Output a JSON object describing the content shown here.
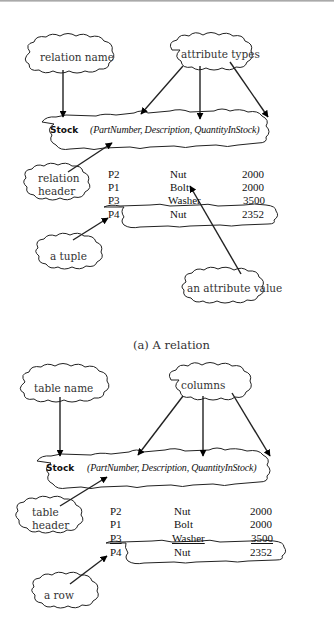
{
  "diagrams": [
    {
      "caption": "(a) A relation",
      "name_label": "relation name",
      "types_label": "attribute types",
      "header_label_line1": "relation",
      "header_label_line2": "header",
      "row_label": "a tuple",
      "value_label": "an attribute value",
      "header": {
        "name": "Stock",
        "attributes": "(PartNumber, Description, QuantityInStock)"
      },
      "rows": [
        [
          "P2",
          "Nut",
          "2000"
        ],
        [
          "P1",
          "Bolt",
          "2000"
        ],
        [
          "P3",
          "Washer",
          "3500"
        ],
        [
          "P4",
          "Nut",
          "2352"
        ]
      ]
    },
    {
      "name_label": "table name",
      "types_label": "columns",
      "header_label_line1": "table",
      "header_label_line2": "header",
      "row_label": "a row",
      "header": {
        "name": "Stock",
        "attributes": "(PartNumber, Description, QuantityInStock)"
      },
      "rows": [
        [
          "P2",
          "Nut",
          "2000"
        ],
        [
          "P1",
          "Bolt",
          "2000"
        ],
        [
          "P3",
          "Washer",
          "3500"
        ],
        [
          "P4",
          "Nut",
          "2352"
        ]
      ]
    }
  ]
}
